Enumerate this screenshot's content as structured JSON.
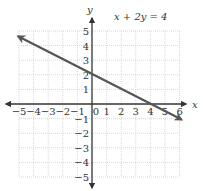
{
  "chart_data": {
    "type": "line",
    "title": "x + 2y = 4",
    "xlabel": "x",
    "ylabel": "y",
    "xlim": [
      -5,
      6
    ],
    "ylim": [
      -5,
      5
    ],
    "grid": true,
    "x_ticks": [
      "-5",
      "-4",
      "-3",
      "-2",
      "-1",
      "0",
      "1",
      "2",
      "3",
      "4",
      "5",
      "6"
    ],
    "y_ticks": [
      "5",
      "4",
      "3",
      "2",
      "1",
      "-1",
      "-2",
      "-3",
      "-4",
      "-5"
    ],
    "series": [
      {
        "name": "x + 2y = 4",
        "equation": "x + 2y = 4",
        "x": [
          -5,
          0,
          4,
          6
        ],
        "y": [
          4.5,
          2,
          0,
          -1
        ],
        "arrows_both_ends": true
      }
    ]
  },
  "labels": {
    "equation": "x + 2y = 4",
    "x_axis": "x",
    "y_axis": "y"
  }
}
